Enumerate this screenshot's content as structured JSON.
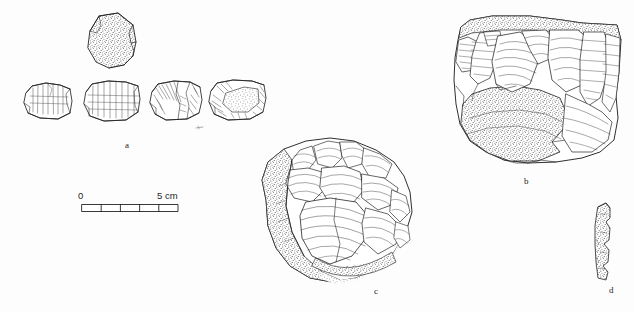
{
  "plate": {
    "width": 634,
    "height": 312,
    "background_color": "#fdfdfd",
    "ink_color": "#242424",
    "stipple_color": "#3a3a3a",
    "caption_note": "Archaeological line drawing plate of knapped flint artefacts"
  },
  "scale_bar": {
    "name": "scale-bar",
    "start_label": "0",
    "end_label": "5 cm",
    "unit": "cm",
    "length_cm": 5,
    "divisions": 5,
    "bar_x": 82,
    "bar_y": 204,
    "bar_width": 96,
    "bar_height": 7
  },
  "figures": [
    {
      "id": "a",
      "label": "a",
      "label_x": 125,
      "label_y": 141,
      "description": "Group of five refitting flint fragments: one stippled cortical piece above, four retouched flake side-views below",
      "piece_count": 5
    },
    {
      "id": "b",
      "label": "b",
      "label_x": 524,
      "label_y": 177,
      "description": "Large flint core with flake scars on upper face and stippled cortex across lower body",
      "piece_count": 1
    },
    {
      "id": "c",
      "label": "c",
      "label_x": 374,
      "label_y": 287,
      "description": "Rounded discoidal flint core with radial flake scars and stippled cortex on lower left",
      "piece_count": 1
    },
    {
      "id": "d",
      "label": "d",
      "label_x": 609,
      "label_y": 286,
      "description": "Narrow elongated stippled flake with denticulate notched left margin",
      "piece_count": 1
    }
  ]
}
